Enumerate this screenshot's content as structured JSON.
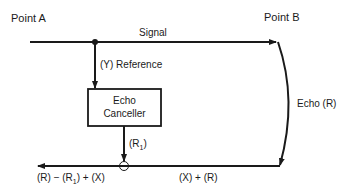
{
  "diagram": {
    "point_a": "Point A",
    "point_b": "Point B",
    "signal": "Signal",
    "reference": "(Y) Reference",
    "box_line1": "Echo",
    "box_line2": "Canceller",
    "r1": "(R",
    "r1_sub": "1",
    "r1_close": ")",
    "echo": "Echo (R)",
    "return_right": "(X) + (R)",
    "output_part1": "(R) − (R",
    "output_sub": "1",
    "output_part2": ") + (X)"
  }
}
